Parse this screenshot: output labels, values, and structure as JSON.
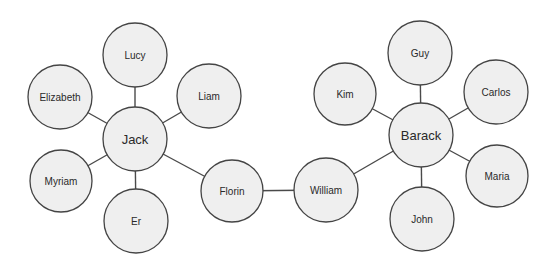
{
  "diagram": {
    "type": "network-graph",
    "nodes": [
      {
        "id": "jack",
        "label": "Jack",
        "x": 135,
        "y": 139,
        "r": 32,
        "hub": true
      },
      {
        "id": "lucy",
        "label": "Lucy",
        "x": 135,
        "y": 55,
        "r": 32
      },
      {
        "id": "elizabeth",
        "label": "Elizabeth",
        "x": 60,
        "y": 97,
        "r": 32
      },
      {
        "id": "liam",
        "label": "Liam",
        "x": 209,
        "y": 96,
        "r": 32
      },
      {
        "id": "myriam",
        "label": "Myriam",
        "x": 61,
        "y": 181,
        "r": 31
      },
      {
        "id": "er",
        "label": "Er",
        "x": 136,
        "y": 221,
        "r": 32
      },
      {
        "id": "florin",
        "label": "Florin",
        "x": 232,
        "y": 191,
        "r": 31
      },
      {
        "id": "william",
        "label": "William",
        "x": 326,
        "y": 190,
        "r": 32
      },
      {
        "id": "barack",
        "label": "Barack",
        "x": 421,
        "y": 135,
        "r": 32,
        "hub": true
      },
      {
        "id": "guy",
        "label": "Guy",
        "x": 420,
        "y": 53,
        "r": 32
      },
      {
        "id": "kim",
        "label": "Kim",
        "x": 345,
        "y": 94,
        "r": 31
      },
      {
        "id": "carlos",
        "label": "Carlos",
        "x": 496,
        "y": 92,
        "r": 32
      },
      {
        "id": "maria",
        "label": "Maria",
        "x": 497,
        "y": 176,
        "r": 31
      },
      {
        "id": "john",
        "label": "John",
        "x": 422,
        "y": 219,
        "r": 32
      }
    ],
    "edges": [
      [
        "jack",
        "lucy"
      ],
      [
        "jack",
        "elizabeth"
      ],
      [
        "jack",
        "liam"
      ],
      [
        "jack",
        "myriam"
      ],
      [
        "jack",
        "er"
      ],
      [
        "jack",
        "florin"
      ],
      [
        "florin",
        "william"
      ],
      [
        "william",
        "barack"
      ],
      [
        "barack",
        "guy"
      ],
      [
        "barack",
        "kim"
      ],
      [
        "barack",
        "carlos"
      ],
      [
        "barack",
        "maria"
      ],
      [
        "barack",
        "john"
      ]
    ]
  }
}
